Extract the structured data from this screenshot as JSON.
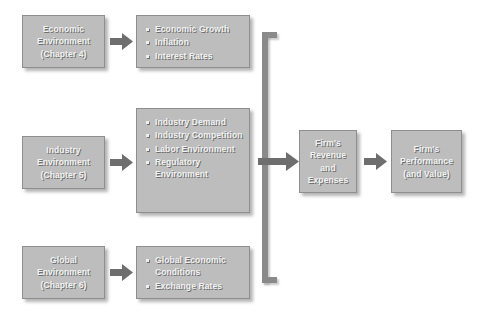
{
  "colors": {
    "box_fill": "#bdbdbd",
    "box_border": "#8e8e8e",
    "text": "#f2f2f2",
    "text_shadow": "#6e6e6e",
    "arrow_fill": "#6e6e6e",
    "connector": "#8a8a8a"
  },
  "sources": [
    {
      "id": "economic",
      "line1": "Economic",
      "line2": "Environment",
      "line3": "(Chapter 4)"
    },
    {
      "id": "industry",
      "line1": "Industry",
      "line2": "Environment",
      "line3": "(Chapter 5)"
    },
    {
      "id": "global",
      "line1": "Global",
      "line2": "Environment",
      "line3": "(Chapter 6)"
    }
  ],
  "factor_lists": [
    {
      "id": "economic-factors",
      "items": [
        "Economic Growth",
        "Inflation",
        "Interest Rates"
      ]
    },
    {
      "id": "industry-factors",
      "items": [
        "Industry Demand",
        "Industry Competition",
        "Labor Environment",
        "Regulatory Environment"
      ]
    },
    {
      "id": "global-factors",
      "items": [
        "Global Economic Conditions",
        "Exchange Rates"
      ]
    }
  ],
  "outcomes": [
    {
      "id": "revenue",
      "line1": "Firm's",
      "line2": "Revenue",
      "line3": "and",
      "line4": "Expenses"
    },
    {
      "id": "performance",
      "line1": "Firm's",
      "line2": "Performance",
      "line3": "(and Value)"
    }
  ],
  "arrows": {
    "economic_label": "arrow-economic-to-factors",
    "industry_label": "arrow-industry-to-factors",
    "global_label": "arrow-global-to-factors",
    "junction_label": "arrow-junction-to-revenue",
    "revenue_label": "arrow-revenue-to-performance"
  }
}
